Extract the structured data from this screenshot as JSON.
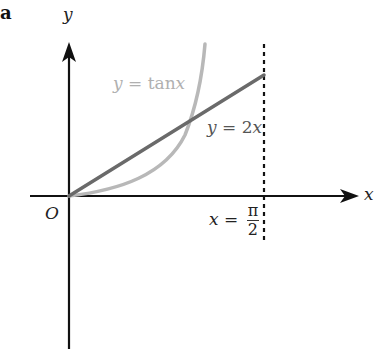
{
  "part_label": "a",
  "axes": {
    "x_label": "x",
    "y_label": "y",
    "origin_label": "O"
  },
  "curves": [
    {
      "name": "tan",
      "label_lhs": "y",
      "label_eq": " = ",
      "label_rhs": "tan",
      "label_var": "x",
      "color": "#b8b8b8"
    },
    {
      "name": "line",
      "label_lhs": "y",
      "label_eq": " = ",
      "label_rhs": "2",
      "label_var": "x",
      "color": "#6a6a6a"
    }
  ],
  "asymptote": {
    "label_lhs": "x",
    "label_eq": " = ",
    "numerator": "π",
    "denominator": "2",
    "style": "dashed",
    "color": "#111111"
  },
  "colors": {
    "axis": "#111111",
    "tan_curve": "#b8b8b8",
    "line": "#6a6a6a"
  }
}
